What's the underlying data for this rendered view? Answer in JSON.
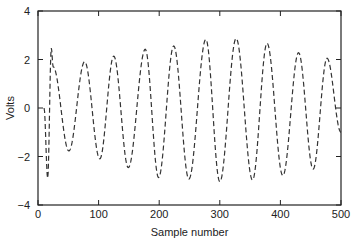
{
  "chart_data": {
    "type": "line",
    "title": "",
    "xlabel": "Sample number",
    "ylabel": "Volts",
    "xlim": [
      0,
      500
    ],
    "ylim": [
      -4,
      4
    ],
    "xticks": [
      0,
      100,
      200,
      300,
      400,
      500
    ],
    "yticks": [
      -4,
      -2,
      0,
      2,
      4
    ],
    "xtick_labels": [
      "0",
      "100",
      "200",
      "300",
      "400",
      "500"
    ],
    "ytick_labels": [
      "−4",
      "−2",
      "0",
      "2",
      "4"
    ],
    "grid": false,
    "legend": null,
    "line_style": "dashed",
    "line_color": "#333333",
    "series": [
      {
        "name": "signal",
        "extrema": [
          {
            "x": 10,
            "y": 0.0
          },
          {
            "x": 16,
            "y": -2.9
          },
          {
            "x": 22,
            "y": 2.47
          },
          {
            "x": 25,
            "y": 1.7
          },
          {
            "x": 51,
            "y": -1.77
          },
          {
            "x": 77,
            "y": 1.91
          },
          {
            "x": 102,
            "y": -2.1
          },
          {
            "x": 125,
            "y": 2.14
          },
          {
            "x": 149,
            "y": -2.46
          },
          {
            "x": 177,
            "y": 2.42
          },
          {
            "x": 199,
            "y": -2.87
          },
          {
            "x": 224,
            "y": 2.56
          },
          {
            "x": 249,
            "y": -2.93
          },
          {
            "x": 277,
            "y": 2.83
          },
          {
            "x": 300,
            "y": -3.04
          },
          {
            "x": 327,
            "y": 2.87
          },
          {
            "x": 354,
            "y": -2.97
          },
          {
            "x": 378,
            "y": 2.67
          },
          {
            "x": 404,
            "y": -2.79
          },
          {
            "x": 430,
            "y": 2.28
          },
          {
            "x": 454,
            "y": -2.52
          },
          {
            "x": 477,
            "y": 2.05
          },
          {
            "x": 500,
            "y": -1.0
          }
        ]
      }
    ]
  }
}
